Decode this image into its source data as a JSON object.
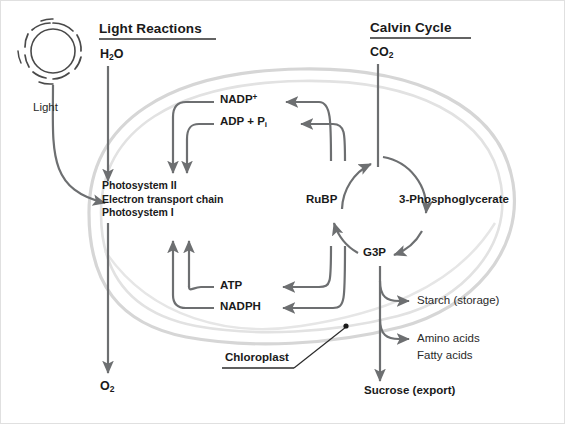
{
  "diagram": {
    "colors": {
      "arrow": "#6d6f71",
      "text": "#1a1a1a",
      "membrane_outer": "#d4d4d4",
      "membrane_inner": "#c9c9c9",
      "leader": "#2b2b2b"
    }
  },
  "headings": {
    "light_reactions": "Light Reactions",
    "calvin_cycle": "Calvin Cycle"
  },
  "inputs": {
    "water": "H",
    "water_sub": "2",
    "water_tail": "O",
    "co2": "CO",
    "co2_sub": "2",
    "light_label": "Light",
    "light_icon": "sun-icon"
  },
  "outputs": {
    "oxygen": "O",
    "oxygen_sub": "2",
    "sucrose": "Sucrose (export)"
  },
  "light_reaction_machinery": {
    "line1": "Photosystem II",
    "line2": "Electron transport chain",
    "line3": "Photosystem I"
  },
  "carriers": {
    "nadp_plus": "NADP",
    "nadp_plus_sup": "+",
    "adp_pi": "ADP + P",
    "adp_pi_sub": "i",
    "atp": "ATP",
    "nadph": "NADPH"
  },
  "calvin_intermediates": {
    "rubp": "RuBP",
    "pga": "3-Phosphoglycerate",
    "g3p": "G3P"
  },
  "products": {
    "starch": "Starch (storage)",
    "amino_acids": "Amino acids",
    "fatty_acids": "Fatty acids"
  },
  "callout": {
    "chloroplast": "Chloroplast"
  }
}
